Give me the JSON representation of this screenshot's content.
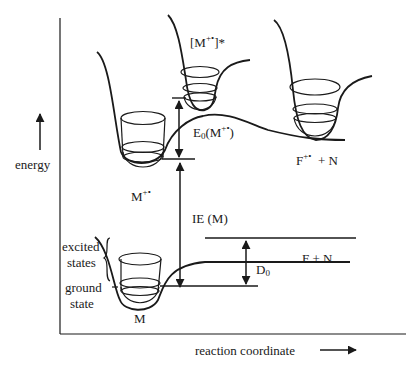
{
  "diagram": {
    "type": "potential-energy-diagram",
    "axes": {
      "y_label": "energy",
      "x_label": "reaction coordinate"
    },
    "labels": {
      "excited_ion": "[M+•]*",
      "excited_ion_base": "[M",
      "excited_ion_sup": "+•",
      "excited_ion_tail": "]*",
      "ion": "M+•",
      "ion_base": "M",
      "ion_sup": "+•",
      "fragment_ion": "F+• + N",
      "fragment_ion_base": "F",
      "fragment_ion_sup": "+•",
      "fragment_ion_tail": "+  N",
      "e0": "E0(M+•)",
      "e0_base": "E",
      "e0_sub": "0",
      "e0_paren_open": "(M",
      "e0_sup": "+•",
      "e0_paren_close": ")",
      "ie": "IE (M)",
      "neutral": "M",
      "neutral_fragments": "F  +  N",
      "d0": "D0",
      "d0_base": "D",
      "d0_sub": "0",
      "excited": "excited",
      "states": "states",
      "ground": "ground",
      "state": "state"
    },
    "colors": {
      "line": "#1a1a1a",
      "background": "#ffffff"
    }
  }
}
